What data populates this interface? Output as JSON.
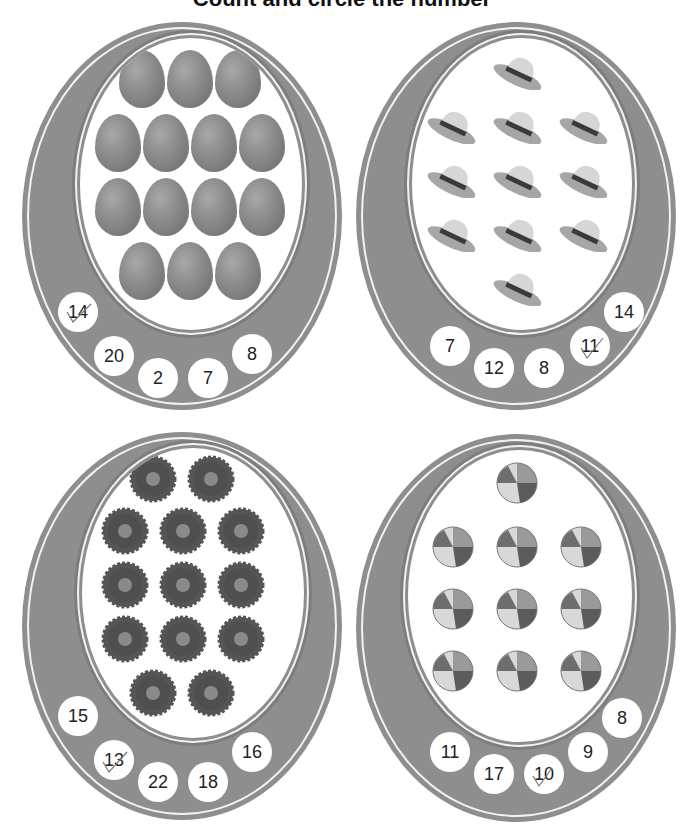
{
  "title": "Count and circle the number",
  "colors": {
    "band": "#8e8e8e",
    "band_line": "#f2f2f2",
    "inner": "#ffffff",
    "number_text": "#222222"
  },
  "cards": [
    {
      "id": "eggs",
      "object": "egg",
      "object_icon": "egg-icon",
      "count": 14,
      "layout_rows": [
        3,
        4,
        4,
        3
      ],
      "options": [
        "14",
        "20",
        "2",
        "7",
        "8"
      ],
      "checked": "14"
    },
    {
      "id": "hats",
      "object": "hat",
      "object_icon": "hat-icon",
      "count": 11,
      "layout_rows": [
        1,
        3,
        3,
        3,
        1
      ],
      "options": [
        "7",
        "12",
        "8",
        "11",
        "14"
      ],
      "checked": "11"
    },
    {
      "id": "flowers",
      "object": "flower",
      "object_icon": "flower-icon",
      "count": 13,
      "layout_rows": [
        2,
        3,
        3,
        3,
        2
      ],
      "options": [
        "15",
        "13",
        "22",
        "18",
        "16"
      ],
      "checked": "13"
    },
    {
      "id": "balls",
      "object": "beach ball",
      "object_icon": "beach-ball-icon",
      "count": 10,
      "layout_rows": [
        1,
        3,
        3,
        3
      ],
      "options": [
        "11",
        "17",
        "10",
        "9",
        "8"
      ],
      "checked": "10"
    }
  ]
}
